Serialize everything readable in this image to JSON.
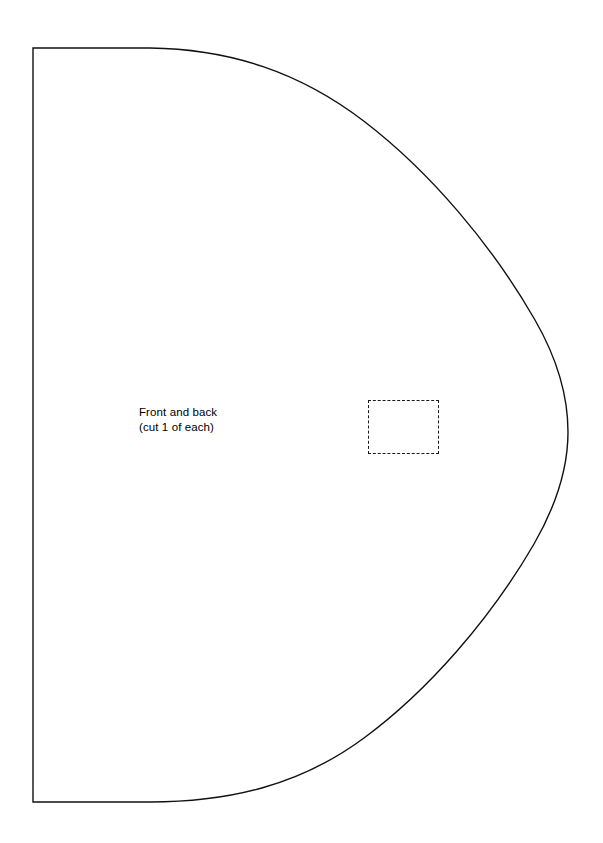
{
  "page": {
    "background_color": "#ffffff",
    "width": 603,
    "height": 843
  },
  "pattern": {
    "name": "half-oval-pattern-piece",
    "stroke_color": "#111111",
    "fill_color": "#ffffff",
    "stroke_width": 1.4,
    "description": "D-shaped pattern piece with straight left edge and curved right side"
  },
  "label": {
    "line1": "Front and back",
    "line2": "(cut 1 of each)"
  },
  "placement_square": {
    "name": "dashed-placement-square",
    "stroke_color": "#1a1a1a",
    "stroke_style": "dashed",
    "x": 368,
    "y": 400,
    "width": 71,
    "height": 54
  }
}
